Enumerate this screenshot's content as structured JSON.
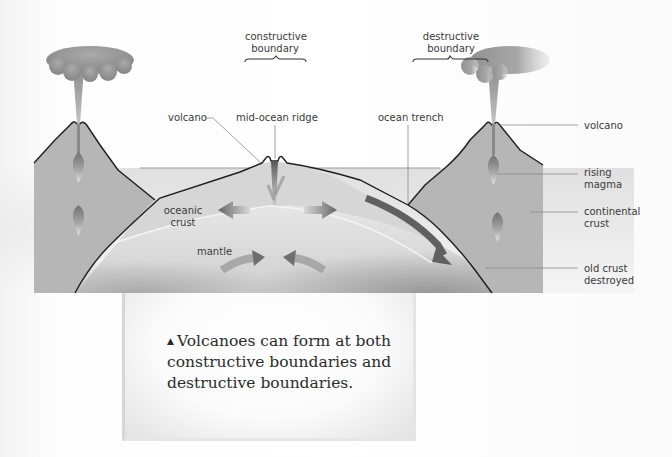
{
  "diagram": {
    "boundaries": [
      {
        "id": "constructive",
        "label_line1": "constructive",
        "label_line2": "boundary"
      },
      {
        "id": "destructive",
        "label_line1": "destructive",
        "label_line2": "boundary"
      }
    ],
    "labels": {
      "volcano_left": "volcano",
      "mid_ocean_ridge": "mid-ocean ridge",
      "ocean_trench": "ocean trench",
      "volcano_right": "volcano",
      "rising_magma_1": "rising",
      "rising_magma_2": "magma",
      "continental_crust_1": "continental",
      "continental_crust_2": "crust",
      "oceanic_crust_1": "oceanic",
      "oceanic_crust_2": "crust",
      "mantle": "mantle",
      "old_crust_1": "old crust",
      "old_crust_2": "destroyed"
    },
    "colors": {
      "continental_crust": "#b4b4b4",
      "oceanic_crust": "#d2d2d2",
      "mantle": "#dadada",
      "ocean": "#e8e8e8",
      "outline": "#1e1e1e",
      "arrow": "#6e6e6e"
    }
  },
  "caption": {
    "marker": "▲",
    "text": "Volcanoes can form at both constructive boundaries and destructive boundaries."
  }
}
